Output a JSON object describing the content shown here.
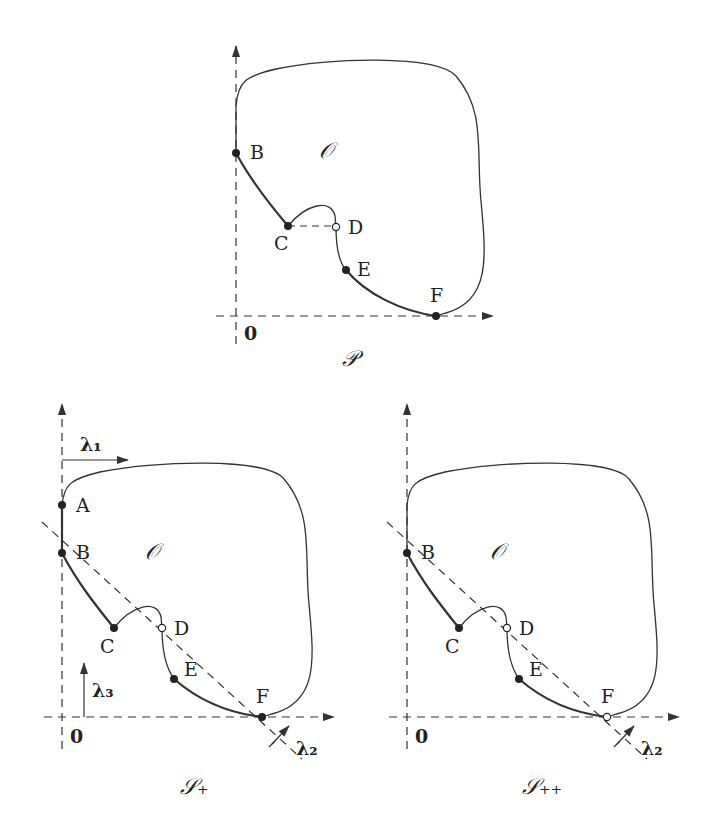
{
  "panels": [
    {
      "id": "P",
      "caption": "𝒫",
      "origin_label": "0",
      "region_label": "𝒪",
      "points": {
        "B": "filled",
        "C": "filled",
        "D": "open",
        "E": "filled",
        "F": "filled"
      },
      "labels": {
        "B": "B",
        "C": "C",
        "D": "D",
        "E": "E",
        "F": "F"
      }
    },
    {
      "id": "S_plus",
      "caption": "𝒮₊",
      "origin_label": "0",
      "region_label": "𝒪",
      "points": {
        "A": "filled",
        "B": "filled",
        "C": "filled",
        "D": "open",
        "E": "filled",
        "F": "filled"
      },
      "labels": {
        "A": "A",
        "B": "B",
        "C": "C",
        "D": "D",
        "E": "E",
        "F": "F"
      },
      "vectors": {
        "lambda1": "λ₁",
        "lambda2": "λ₂",
        "lambda3": "λ₃"
      }
    },
    {
      "id": "S_plusplus",
      "caption": "𝒮₊₊",
      "origin_label": "0",
      "region_label": "𝒪",
      "points": {
        "B": "filled",
        "C": "filled",
        "D": "open",
        "E": "filled",
        "F": "open"
      },
      "labels": {
        "B": "B",
        "C": "C",
        "D": "D",
        "E": "E",
        "F": "F"
      },
      "vectors": {
        "lambda2": "λ₂"
      }
    }
  ]
}
